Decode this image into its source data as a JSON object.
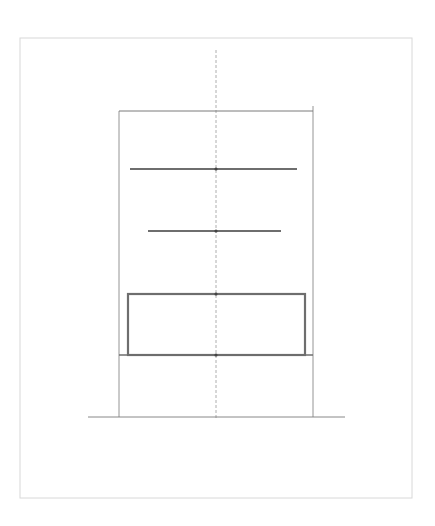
{
  "diagram": {
    "type": "elevation-sketch",
    "colors": {
      "background": "#ffffff",
      "frame": "#d8d8d8",
      "thin_line": "#7a7a7a",
      "thick_line": "#6e6e6e",
      "center_line": "#9a9a9a"
    },
    "frame": {
      "x": 20,
      "y": 38,
      "width": 392,
      "height": 460
    },
    "center_axis": {
      "x": 216,
      "y1": 50,
      "y2": 418
    },
    "outline": {
      "left_x": 119,
      "right_x": 313,
      "top_y": 111,
      "right_top_y": 106,
      "bottom_y": 417
    },
    "shelves": [
      {
        "x1": 130,
        "x2": 297,
        "y": 169
      },
      {
        "x1": 148,
        "x2": 281,
        "y": 231
      }
    ],
    "box": {
      "x": 128,
      "y": 294,
      "width": 177,
      "height": 61
    },
    "base_line": {
      "x1": 119,
      "x2": 313,
      "y": 355
    },
    "ground_line": {
      "x1": 88,
      "x2": 345,
      "y": 417
    },
    "nodes": [
      {
        "x": 216,
        "y": 169
      },
      {
        "x": 216,
        "y": 231
      },
      {
        "x": 216,
        "y": 294
      },
      {
        "x": 216,
        "y": 355
      }
    ]
  }
}
